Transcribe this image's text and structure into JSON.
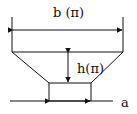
{
  "diagram": {
    "labels": {
      "width": "b (π)",
      "height": "h(π)",
      "base": "a"
    },
    "colors": {
      "stroke": "#111111",
      "background": "#ffffff"
    }
  }
}
